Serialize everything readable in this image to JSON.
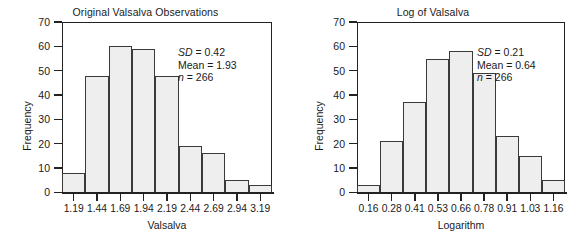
{
  "figure": {
    "ylabel": "Frequency"
  },
  "chart_data": [
    {
      "type": "bar",
      "title": "Original Valsalva Observations",
      "xlabel": "Valsalva",
      "ylabel": "Frequency",
      "categories": [
        "1.19",
        "1.44",
        "1.69",
        "1.94",
        "2.19",
        "2.44",
        "2.69",
        "2.94",
        "3.19"
      ],
      "values": [
        8,
        48,
        60,
        59,
        48,
        19,
        16,
        5,
        3
      ],
      "ylim": [
        0,
        70
      ],
      "yticks": [
        0,
        10,
        20,
        30,
        40,
        50,
        60,
        70
      ],
      "grid": false,
      "legend": "none",
      "annotations": {
        "sd_label": "SD",
        "sd_value": " = 0.42",
        "mean_label": "Mean",
        "mean_value": " = 1.93",
        "n_label": "n",
        "n_value": " = 266"
      }
    },
    {
      "type": "bar",
      "title": "Log of Valsalva",
      "xlabel": "Logarithm",
      "ylabel": "Frequency",
      "categories": [
        "0.16",
        "0.28",
        "0.41",
        "0.53",
        "0.66",
        "0.78",
        "0.91",
        "1.03",
        "1.16"
      ],
      "values": [
        3,
        21,
        37,
        55,
        58,
        49,
        23,
        15,
        5
      ],
      "ylim": [
        0,
        70
      ],
      "yticks": [
        0,
        10,
        20,
        30,
        40,
        50,
        60,
        70
      ],
      "grid": false,
      "legend": "none",
      "annotations": {
        "sd_label": "SD",
        "sd_value": " = 0.21",
        "mean_label": "Mean",
        "mean_value": " = 0.64",
        "n_label": "n",
        "n_value": " = 266"
      }
    }
  ]
}
